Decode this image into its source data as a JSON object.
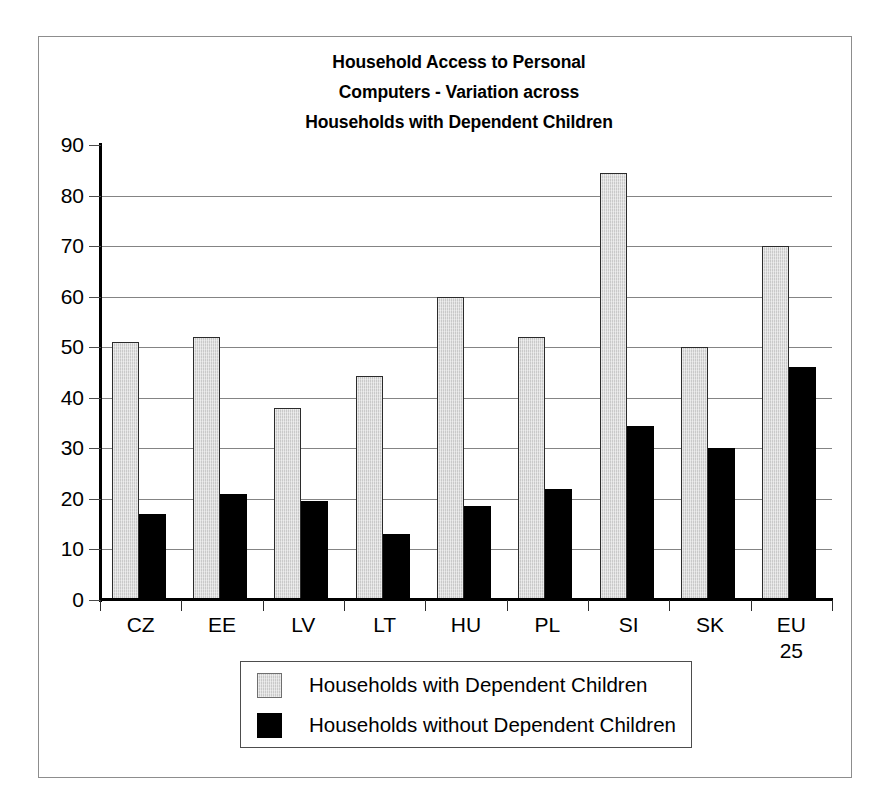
{
  "chart_data": {
    "type": "bar",
    "title": "Household Access to Personal Computers - Variation across Households with Dependent Children",
    "title_lines": [
      "Household Access to Personal",
      "Computers - Variation across",
      "Households with Dependent Children"
    ],
    "xlabel": "",
    "ylabel": "",
    "ylim": [
      0,
      90
    ],
    "ytick_step": 10,
    "yticks": [
      0,
      10,
      20,
      30,
      40,
      50,
      60,
      70,
      80,
      90
    ],
    "ytick_labels": [
      "0",
      "10",
      "20",
      "30",
      "40",
      "50",
      "60",
      "70",
      "80",
      "90"
    ],
    "grid": true,
    "grid_axis": "y",
    "legend_position": "below-plot-center",
    "categories": [
      "CZ",
      "EE",
      "LV",
      "LT",
      "HU",
      "PL",
      "SI",
      "SK",
      "EU 25"
    ],
    "category_labels": [
      [
        "CZ"
      ],
      [
        "EE"
      ],
      [
        "LV"
      ],
      [
        "LT"
      ],
      [
        "HU"
      ],
      [
        "PL"
      ],
      [
        "SI"
      ],
      [
        "SK"
      ],
      [
        "EU",
        "25"
      ]
    ],
    "series": [
      {
        "name": "Households with Dependent Children",
        "color": "#c9c9c9",
        "values": [
          51,
          52,
          38,
          44.3,
          60,
          52,
          84.5,
          50,
          70
        ]
      },
      {
        "name": "Households without Dependent Children",
        "color": "#000000",
        "values": [
          17,
          21,
          19.5,
          13,
          18.5,
          22,
          34.5,
          30,
          46
        ]
      }
    ]
  },
  "legend": {
    "entries": [
      "Households with Dependent Children",
      "Households without Dependent Children"
    ]
  },
  "colors": {
    "series_with_children": "#c9c9c9",
    "series_without_children": "#000000",
    "gridline": "#848484",
    "axis": "#000000",
    "frame": "#8d8d8d"
  }
}
